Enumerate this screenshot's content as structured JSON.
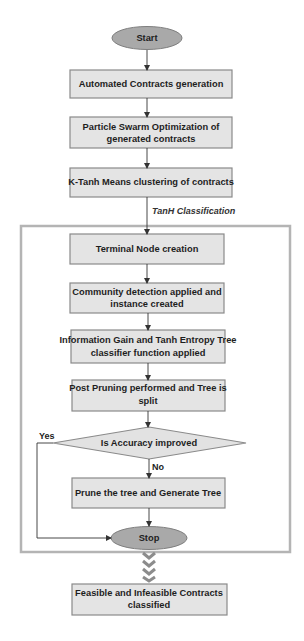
{
  "diagram": {
    "type": "flowchart",
    "colors": {
      "process_fill": "#e4e4e4",
      "process_stroke": "#8a8a8a",
      "terminator_fill": "#a9a9a9",
      "decision_fill": "#e2e2e2",
      "frame_stroke": "#b4b4b4",
      "connector": "#333333",
      "chevron": "#8c8c8c"
    },
    "start": {
      "label": "Start"
    },
    "steps_before": [
      {
        "label_lines": [
          "Automated Contracts generation"
        ]
      },
      {
        "label_lines": [
          "Particle Swarm Optimization of",
          "generated contracts"
        ]
      },
      {
        "label_lines": [
          "K-Tanh Means clustering of contracts"
        ]
      }
    ],
    "section_label": "TanH Classification",
    "steps_inside": [
      {
        "label_lines": [
          "Terminal Node creation"
        ]
      },
      {
        "label_lines": [
          "Community detection applied and",
          "instance created"
        ]
      },
      {
        "label_lines": [
          "Information Gain and Tanh Entropy Tree",
          "classifier function applied"
        ]
      },
      {
        "label_lines": [
          "Post Pruning performed and Tree is",
          "split"
        ]
      }
    ],
    "decision": {
      "label": "Is Accuracy improved",
      "yes_label": "Yes",
      "no_label": "No"
    },
    "prune_step": {
      "label_lines": [
        "Prune the tree and Generate Tree"
      ]
    },
    "stop": {
      "label": "Stop"
    },
    "result": {
      "label_lines": [
        "Feasible and Infeasible Contracts",
        "classified"
      ]
    }
  }
}
